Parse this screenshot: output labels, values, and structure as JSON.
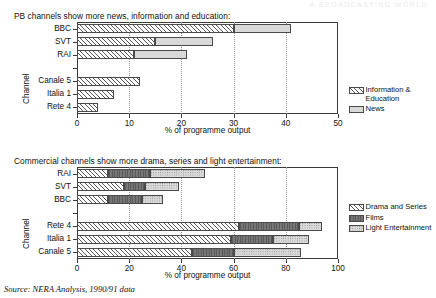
{
  "faint_header": "A BROADCASTING WORLD",
  "source_note": "Source: NERA Analysis, 1990/91 data",
  "charts": [
    {
      "id": "pb-channels",
      "title": "PB channels show more news, information and education:",
      "xlabel": "% of programme output",
      "ylabel": "Channel",
      "xlim": [
        0,
        50
      ],
      "xticks": [
        0,
        10,
        20,
        30,
        40,
        50
      ],
      "categories": [
        "BBC",
        "SVT",
        "RAI",
        "",
        "Canale 5",
        "Italia 1",
        "Rete 4"
      ],
      "legend": [
        {
          "label": "Information &\nEducation",
          "pattern": "pat-hatch"
        },
        {
          "label": "News",
          "pattern": "pat-light"
        }
      ]
    },
    {
      "id": "commercial-channels",
      "title": "Commercial channels show more drama, series and light entertainment:",
      "xlabel": "% of programme output",
      "ylabel": "Channel",
      "xlim": [
        0,
        100
      ],
      "xticks": [
        0,
        20,
        40,
        60,
        80,
        100
      ],
      "categories": [
        "RAI",
        "SVT",
        "BBC",
        "",
        "Rete 4",
        "Italia 1",
        "Canale 5"
      ],
      "legend": [
        {
          "label": "Drama and Series",
          "pattern": "pat-hatch"
        },
        {
          "label": "Films",
          "pattern": "pat-dark"
        },
        {
          "label": "Light Entertainment",
          "pattern": "pat-stipple"
        }
      ]
    }
  ],
  "chart_data": [
    {
      "type": "bar",
      "orientation": "horizontal",
      "stacked": true,
      "title": "PB channels show more news, information and education:",
      "xlabel": "% of programme output",
      "ylabel": "Channel",
      "xlim": [
        0,
        50
      ],
      "xticks": [
        0,
        10,
        20,
        30,
        40,
        50
      ],
      "grid": "vertical-dotted",
      "legend_position": "right",
      "categories": [
        "BBC",
        "SVT",
        "RAI",
        "Canale 5",
        "Italia 1",
        "Rete 4"
      ],
      "series": [
        {
          "name": "Information & Education",
          "values": [
            30,
            15,
            11,
            12,
            7,
            4
          ]
        },
        {
          "name": "News",
          "values": [
            11,
            11,
            10,
            0,
            0,
            0
          ]
        }
      ],
      "totals": [
        41,
        26,
        21,
        12,
        7,
        4
      ]
    },
    {
      "type": "bar",
      "orientation": "horizontal",
      "stacked": true,
      "title": "Commercial channels show more drama, series and light entertainment:",
      "xlabel": "% of programme output",
      "ylabel": "Channel",
      "xlim": [
        0,
        100
      ],
      "xticks": [
        0,
        20,
        40,
        60,
        80,
        100
      ],
      "grid": "vertical-dotted",
      "legend_position": "right",
      "categories": [
        "RAI",
        "SVT",
        "BBC",
        "Rete 4",
        "Italia 1",
        "Canale 5"
      ],
      "series": [
        {
          "name": "Drama and Series",
          "values": [
            12,
            18,
            12,
            62,
            59,
            44
          ]
        },
        {
          "name": "Films",
          "values": [
            16,
            8,
            13,
            23,
            16,
            16
          ]
        },
        {
          "name": "Light Entertainment",
          "values": [
            21,
            13,
            8,
            9,
            14,
            26
          ]
        }
      ],
      "totals": [
        49,
        39,
        33,
        94,
        89,
        86
      ]
    }
  ],
  "bars": {
    "pb": [
      {
        "cat": "BBC",
        "row": 0,
        "segs": [
          {
            "start": 0,
            "end": 30,
            "pattern": "pat-hatch"
          },
          {
            "start": 30,
            "end": 41,
            "pattern": "pat-light"
          }
        ]
      },
      {
        "cat": "SVT",
        "row": 1,
        "segs": [
          {
            "start": 0,
            "end": 15,
            "pattern": "pat-hatch"
          },
          {
            "start": 15,
            "end": 26,
            "pattern": "pat-light"
          }
        ]
      },
      {
        "cat": "RAI",
        "row": 2,
        "segs": [
          {
            "start": 0,
            "end": 11,
            "pattern": "pat-hatch"
          },
          {
            "start": 11,
            "end": 21,
            "pattern": "pat-light"
          }
        ]
      },
      {
        "cat": "Canale 5",
        "row": 4,
        "segs": [
          {
            "start": 0,
            "end": 12,
            "pattern": "pat-hatch"
          }
        ]
      },
      {
        "cat": "Italia 1",
        "row": 5,
        "segs": [
          {
            "start": 0,
            "end": 7,
            "pattern": "pat-hatch"
          }
        ]
      },
      {
        "cat": "Rete 4",
        "row": 6,
        "segs": [
          {
            "start": 0,
            "end": 4,
            "pattern": "pat-hatch"
          }
        ]
      }
    ],
    "commercial": [
      {
        "cat": "RAI",
        "row": 0,
        "segs": [
          {
            "start": 0,
            "end": 12,
            "pattern": "pat-hatch"
          },
          {
            "start": 12,
            "end": 28,
            "pattern": "pat-dark"
          },
          {
            "start": 28,
            "end": 49,
            "pattern": "pat-stipple"
          }
        ]
      },
      {
        "cat": "SVT",
        "row": 1,
        "segs": [
          {
            "start": 0,
            "end": 18,
            "pattern": "pat-hatch"
          },
          {
            "start": 18,
            "end": 26,
            "pattern": "pat-dark"
          },
          {
            "start": 26,
            "end": 39,
            "pattern": "pat-stipple"
          }
        ]
      },
      {
        "cat": "BBC",
        "row": 2,
        "segs": [
          {
            "start": 0,
            "end": 12,
            "pattern": "pat-hatch"
          },
          {
            "start": 12,
            "end": 25,
            "pattern": "pat-dark"
          },
          {
            "start": 25,
            "end": 33,
            "pattern": "pat-stipple"
          }
        ]
      },
      {
        "cat": "Rete 4",
        "row": 4,
        "segs": [
          {
            "start": 0,
            "end": 62,
            "pattern": "pat-hatch"
          },
          {
            "start": 62,
            "end": 85,
            "pattern": "pat-dark"
          },
          {
            "start": 85,
            "end": 94,
            "pattern": "pat-stipple"
          }
        ]
      },
      {
        "cat": "Italia 1",
        "row": 5,
        "segs": [
          {
            "start": 0,
            "end": 59,
            "pattern": "pat-hatch"
          },
          {
            "start": 59,
            "end": 75,
            "pattern": "pat-dark"
          },
          {
            "start": 75,
            "end": 89,
            "pattern": "pat-stipple"
          }
        ]
      },
      {
        "cat": "Canale 5",
        "row": 6,
        "segs": [
          {
            "start": 0,
            "end": 44,
            "pattern": "pat-hatch"
          },
          {
            "start": 44,
            "end": 60,
            "pattern": "pat-dark"
          },
          {
            "start": 60,
            "end": 86,
            "pattern": "pat-stipple"
          }
        ]
      }
    ]
  }
}
